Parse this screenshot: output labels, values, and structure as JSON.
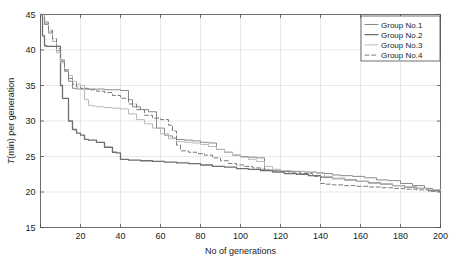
{
  "chart_data": {
    "type": "line",
    "title": "",
    "xlabel": "No of generations",
    "ylabel": "T(min) per generation",
    "ylabel_italic_prefix": "T",
    "ylabel_rest": "(min) per generation",
    "xlim": [
      0,
      200
    ],
    "ylim": [
      15,
      45
    ],
    "xticks": [
      0,
      20,
      40,
      60,
      80,
      100,
      120,
      140,
      160,
      180,
      200
    ],
    "xticklabels": [
      "",
      "20",
      "40",
      "60",
      "80",
      "100",
      "120",
      "140",
      "160",
      "180",
      "200"
    ],
    "yticks": [
      15,
      20,
      25,
      30,
      35,
      40,
      45
    ],
    "yticklabels": [
      "15",
      "20",
      "25",
      "30",
      "35",
      "40",
      "45"
    ],
    "grid": true,
    "legend_position": "top-right",
    "series": [
      {
        "name": "Group No.1",
        "label": "Group No.1",
        "style": "solid",
        "color": "#8a8a8a",
        "width": 1.0,
        "x": [
          0,
          2,
          4,
          6,
          8,
          10,
          12,
          14,
          16,
          18,
          20,
          24,
          28,
          32,
          36,
          40,
          44,
          46,
          50,
          54,
          58,
          62,
          64,
          66,
          68,
          72,
          76,
          80,
          84,
          88,
          92,
          96,
          100,
          104,
          108,
          110,
          112,
          116,
          120,
          126,
          132,
          138,
          142,
          146,
          150,
          156,
          162,
          168,
          174,
          180,
          186,
          192,
          196,
          200
        ],
        "y": [
          45.0,
          43.6,
          42.4,
          41.2,
          39.9,
          38.4,
          37.0,
          35.6,
          34.6,
          34.5,
          34.5,
          34.5,
          34.5,
          34.4,
          34.4,
          34.3,
          33.0,
          32.0,
          31.6,
          31.3,
          29.0,
          28.0,
          27.9,
          27.6,
          27.4,
          27.3,
          27.2,
          27.0,
          26.9,
          26.0,
          25.6,
          25.2,
          25.0,
          24.9,
          24.8,
          24.8,
          23.1,
          23.0,
          22.9,
          22.9,
          22.8,
          22.7,
          22.6,
          22.4,
          22.3,
          22.2,
          22.0,
          21.7,
          21.6,
          21.2,
          20.9,
          20.5,
          20.3,
          20.1
        ]
      },
      {
        "name": "Group No.2",
        "label": "Group No.2",
        "style": "solid",
        "color": "#6e6e6e",
        "width": 1.3,
        "x": [
          0,
          1,
          2,
          3,
          5,
          7,
          9,
          10,
          11,
          12,
          14,
          16,
          18,
          20,
          22,
          24,
          28,
          32,
          36,
          38,
          40,
          44,
          50,
          56,
          62,
          68,
          74,
          80,
          86,
          92,
          98,
          104,
          110,
          116,
          122,
          128,
          134,
          140,
          146,
          152,
          158,
          164,
          170,
          176,
          182,
          188,
          194,
          200
        ],
        "y": [
          45.0,
          42.0,
          40.6,
          40.5,
          40.5,
          40.5,
          40.5,
          35.0,
          33.2,
          33.2,
          30.0,
          28.8,
          28.3,
          28.0,
          27.4,
          27.3,
          27.0,
          26.3,
          25.6,
          25.5,
          24.6,
          24.5,
          24.4,
          24.3,
          24.2,
          24.1,
          24.0,
          23.8,
          23.6,
          23.5,
          23.3,
          23.2,
          23.0,
          22.8,
          22.6,
          22.5,
          22.3,
          22.1,
          21.9,
          21.7,
          21.5,
          21.3,
          21.1,
          20.9,
          20.7,
          20.5,
          20.2,
          20.0
        ]
      },
      {
        "name": "Group No.3",
        "label": "Group No.3",
        "style": "solid",
        "color": "#b9b9b9",
        "width": 1.0,
        "x": [
          0,
          2,
          4,
          6,
          8,
          10,
          12,
          14,
          16,
          18,
          20,
          22,
          24,
          26,
          28,
          32,
          36,
          40,
          44,
          48,
          52,
          56,
          60,
          64,
          68,
          72,
          76,
          80,
          84,
          88,
          92,
          96,
          100,
          104,
          108,
          112,
          116,
          120,
          126,
          132,
          138,
          142,
          146,
          152,
          158,
          164,
          170,
          176,
          182,
          188,
          194,
          200
        ],
        "y": [
          45.0,
          44.0,
          42.6,
          41.2,
          39.6,
          38.2,
          37.2,
          36.4,
          35.6,
          35.2,
          35.0,
          33.0,
          32.2,
          32.1,
          32.0,
          31.9,
          31.8,
          31.7,
          31.0,
          30.2,
          29.6,
          29.0,
          28.2,
          27.5,
          27.1,
          27.0,
          26.9,
          26.7,
          26.4,
          26.0,
          25.6,
          25.2,
          24.9,
          24.6,
          24.3,
          23.6,
          23.2,
          23.0,
          22.9,
          22.8,
          22.6,
          22.2,
          21.9,
          21.7,
          21.5,
          21.3,
          21.1,
          20.9,
          20.7,
          20.5,
          20.3,
          20.1
        ]
      },
      {
        "name": "Group No.4",
        "label": "Group No.4",
        "style": "dashed",
        "color": "#7a7a7a",
        "width": 1.0,
        "x": [
          0,
          2,
          4,
          6,
          8,
          10,
          12,
          14,
          16,
          18,
          20,
          24,
          28,
          32,
          36,
          40,
          44,
          48,
          52,
          56,
          60,
          64,
          66,
          68,
          70,
          74,
          78,
          82,
          86,
          90,
          94,
          98,
          102,
          106,
          110,
          114,
          118,
          124,
          130,
          136,
          140,
          142,
          146,
          152,
          158,
          164,
          170,
          176,
          182,
          188,
          194,
          200
        ],
        "y": [
          45.0,
          43.8,
          42.8,
          41.6,
          40.2,
          38.6,
          37.2,
          36.0,
          35.2,
          34.8,
          34.6,
          34.4,
          34.2,
          34.0,
          33.6,
          33.2,
          32.4,
          31.6,
          30.8,
          30.4,
          30.2,
          29.4,
          28.6,
          26.6,
          25.8,
          25.6,
          25.4,
          25.2,
          24.8,
          24.4,
          24.0,
          23.8,
          23.6,
          23.4,
          23.2,
          23.0,
          22.9,
          22.8,
          22.6,
          22.2,
          21.2,
          21.1,
          21.0,
          20.9,
          20.8,
          20.7,
          20.6,
          20.5,
          20.4,
          20.3,
          20.1,
          19.9
        ]
      }
    ]
  },
  "axes": {
    "xlabel": "No of generations",
    "ylabel_italic": "T",
    "ylabel_rest": "(min) per generation"
  },
  "legend": {
    "entries": [
      {
        "label": "Group No.1"
      },
      {
        "label": "Group No.2"
      },
      {
        "label": "Group No.3"
      },
      {
        "label": "Group No.4"
      }
    ]
  },
  "colors": {
    "axis": "#4d4d4d",
    "grid": "#d9d9d9",
    "background": "#ffffff",
    "text": "#1a1a1a"
  }
}
